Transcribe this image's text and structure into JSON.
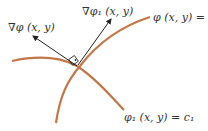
{
  "diagram": {
    "labels": {
      "grad_phi": "∇φ (x, y)",
      "grad_phi1": "∇φ₁ (x, y)",
      "curve_phi": "φ (x, y) = c",
      "curve_phi1": "φ₁ (x, y) = c₁"
    },
    "colors": {
      "curve": "#c0784a",
      "arrow": "#222222",
      "text": "#333333"
    }
  }
}
